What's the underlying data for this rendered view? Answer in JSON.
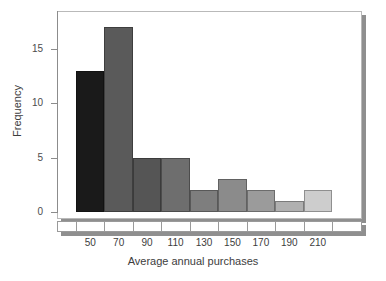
{
  "chart_data": {
    "type": "bar",
    "title": "",
    "subtitle": "",
    "xlabel": "Average annual purchases",
    "ylabel": "Frequency",
    "categories": [
      "50",
      "70",
      "90",
      "110",
      "130",
      "150",
      "170",
      "190",
      "210"
    ],
    "values": [
      13,
      17,
      5,
      5,
      2,
      3,
      2,
      1,
      2
    ],
    "bin_width": 20,
    "bin_edges": [
      40,
      60,
      80,
      100,
      120,
      140,
      160,
      180,
      200,
      220
    ],
    "ylim": [
      0,
      18.6
    ],
    "xlim": [
      40,
      220
    ],
    "ytick_labels": [
      "0",
      "5",
      "10",
      "15"
    ],
    "ytick_values": [
      0,
      5,
      10,
      15
    ],
    "xtick_labels": [
      "50",
      "70",
      "90",
      "110",
      "130",
      "150",
      "170",
      "190",
      "210"
    ],
    "grid": false,
    "legend": null,
    "bar_colors": [
      "#1a1a1a",
      "#5a5a5a",
      "#555555",
      "#6e6e6e",
      "#7e7e7e",
      "#8b8b8b",
      "#9b9b9b",
      "#b0b0b0",
      "#cdcdcd"
    ],
    "bar_edge_color": "#3a3a3a",
    "axis_color": "#8c8c8c",
    "panel_background": "#ffffff",
    "shadow_color": "#8f8f8f"
  }
}
